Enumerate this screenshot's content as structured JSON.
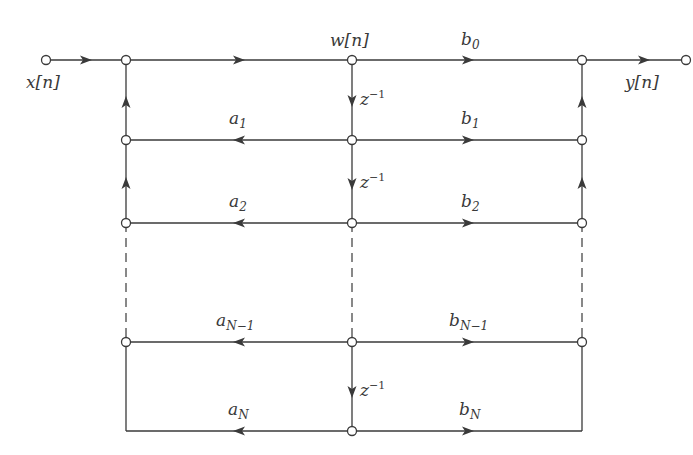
{
  "diagram": {
    "type": "signal-flow-graph",
    "input": {
      "label": "x[n]"
    },
    "output": {
      "label": "y[n]"
    },
    "state": {
      "label": "w[n]"
    },
    "delay_label": {
      "base": "z",
      "exp": "−1"
    },
    "feedback_coefficients": [
      {
        "base": "a",
        "sub": "1"
      },
      {
        "base": "a",
        "sub": "2"
      },
      {
        "base": "a",
        "sub": "N−1"
      },
      {
        "base": "a",
        "sub": "N"
      }
    ],
    "feedforward_coefficients": [
      {
        "base": "b",
        "sub": "0"
      },
      {
        "base": "b",
        "sub": "1"
      },
      {
        "base": "b",
        "sub": "2"
      },
      {
        "base": "b",
        "sub": "N−1"
      },
      {
        "base": "b",
        "sub": "N"
      }
    ],
    "colors": {
      "line": "#3a3a3a",
      "background": "#ffffff"
    }
  }
}
